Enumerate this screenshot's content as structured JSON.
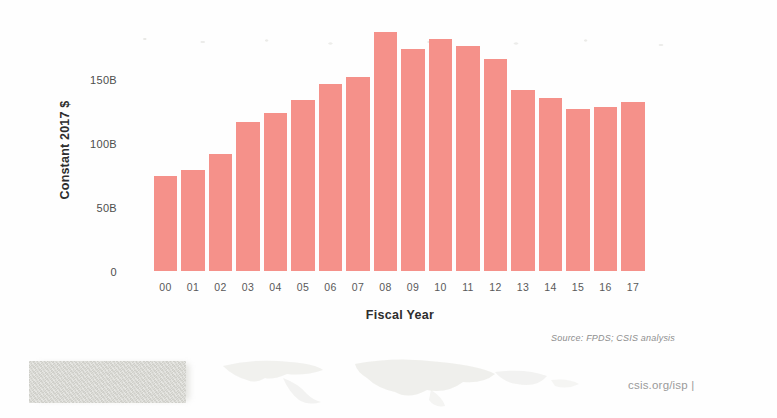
{
  "chart_data": {
    "type": "bar",
    "title": "",
    "xlabel": "Fiscal Year",
    "ylabel": "Constant 2017 $",
    "categories": [
      "00",
      "01",
      "02",
      "03",
      "04",
      "05",
      "06",
      "07",
      "08",
      "09",
      "10",
      "11",
      "12",
      "13",
      "14",
      "15",
      "16",
      "17"
    ],
    "values": [
      74,
      79,
      91,
      116,
      123,
      133,
      146,
      151,
      186,
      173,
      181,
      175,
      165,
      141,
      135,
      126,
      128,
      132
    ],
    "unit": "billions of constant 2017 dollars",
    "ylim": [
      0,
      190
    ],
    "yticks": [
      {
        "value": 0,
        "label": "0"
      },
      {
        "value": 50,
        "label": "50B"
      },
      {
        "value": 100,
        "label": "100B"
      },
      {
        "value": 150,
        "label": "150B"
      }
    ],
    "grid": false,
    "legend": null,
    "bar_color": "#f5918a"
  },
  "source_note": "Source: FPDS; CSIS analysis",
  "footer": {
    "url_text": "csis.org/isp |"
  }
}
